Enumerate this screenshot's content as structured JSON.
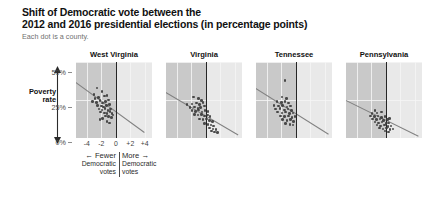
{
  "header": {
    "title_line1": "Shift of Democratic vote between the",
    "title_line2": "2012 and 2016 presidential elections (in percentage points)",
    "subtitle": "Each dot is a county."
  },
  "axes": {
    "y_label_line1": "Poverty",
    "y_label_line2": "rate",
    "y_ticks": [
      "50%",
      "25%",
      "0%"
    ],
    "x_ticks": [
      "-4",
      "-2",
      "0",
      "+2",
      "+4"
    ],
    "x_note_left_arrow": "←",
    "x_note_left_line1": "Fewer",
    "x_note_left_line2": "Democratic",
    "x_note_left_line3": "votes",
    "x_note_right_arrow": "→",
    "x_note_right_line1": "More",
    "x_note_right_line2": "Democratic",
    "x_note_right_line3": "votes"
  },
  "colors": {
    "shade_negative": "#c9c9c9",
    "shade_positive": "#e9e9e9",
    "zero_line": "#262626",
    "dot": "#3d3d3d",
    "trend_line": "#808080",
    "subtitle": "#6f6f6f"
  },
  "chart_data": {
    "type": "scatter",
    "title": "Shift of Democratic vote between the 2012 and 2016 presidential elections (in percentage points)",
    "subtitle": "Each dot is a county.",
    "xlabel": "Shift in Democratic vote (percentage points)",
    "ylabel": "Poverty rate",
    "xlim": [
      -5.5,
      5.0
    ],
    "ylim": [
      0,
      50
    ],
    "x_ticks": [
      -4,
      -2,
      0,
      2,
      4
    ],
    "y_ticks": [
      0,
      25,
      50
    ],
    "grid": true,
    "legend": "none",
    "shaded_region": "x < 0 shaded darker gray; x > 0 lighter gray; dark vertical reference line at x = 0",
    "panels": [
      {
        "name": "West Virginia",
        "trend": {
          "x0": -5.5,
          "y0": 37.0,
          "x1": 4.0,
          "y1": 4.0
        },
        "points": [
          {
            "x": -2.6,
            "y": 33.0
          },
          {
            "x": -3.0,
            "y": 28.5
          },
          {
            "x": -1.9,
            "y": 30.5
          },
          {
            "x": -2.9,
            "y": 26.0
          },
          {
            "x": -2.4,
            "y": 26.5
          },
          {
            "x": -1.6,
            "y": 27.5
          },
          {
            "x": -1.2,
            "y": 28.0
          },
          {
            "x": -3.2,
            "y": 24.0
          },
          {
            "x": -2.7,
            "y": 23.5
          },
          {
            "x": -2.2,
            "y": 24.5
          },
          {
            "x": -1.8,
            "y": 23.0
          },
          {
            "x": -1.4,
            "y": 24.0
          },
          {
            "x": -1.0,
            "y": 25.0
          },
          {
            "x": -2.5,
            "y": 21.5
          },
          {
            "x": -2.0,
            "y": 21.0
          },
          {
            "x": -1.7,
            "y": 20.5
          },
          {
            "x": -1.3,
            "y": 21.5
          },
          {
            "x": -0.9,
            "y": 22.0
          },
          {
            "x": -2.3,
            "y": 19.0
          },
          {
            "x": -1.9,
            "y": 18.5
          },
          {
            "x": -1.5,
            "y": 19.5
          },
          {
            "x": -1.1,
            "y": 18.0
          },
          {
            "x": -0.7,
            "y": 19.0
          },
          {
            "x": -2.1,
            "y": 17.0
          },
          {
            "x": -1.6,
            "y": 16.5
          },
          {
            "x": -1.2,
            "y": 16.0
          },
          {
            "x": -0.8,
            "y": 17.5
          },
          {
            "x": -0.5,
            "y": 16.0
          },
          {
            "x": -1.4,
            "y": 14.5
          },
          {
            "x": -1.0,
            "y": 14.0
          },
          {
            "x": -0.6,
            "y": 13.5
          },
          {
            "x": -1.8,
            "y": 13.0
          },
          {
            "x": -0.4,
            "y": 15.0
          },
          {
            "x": -1.2,
            "y": 11.0
          },
          {
            "x": -0.9,
            "y": 10.0
          },
          {
            "x": -2.2,
            "y": 12.0
          }
        ]
      },
      {
        "name": "Virginia",
        "trend": {
          "x0": -5.5,
          "y0": 30.0,
          "x1": 4.5,
          "y1": 2.0
        },
        "points": [
          {
            "x": -1.7,
            "y": 27.0
          },
          {
            "x": -1.0,
            "y": 26.0
          },
          {
            "x": -0.6,
            "y": 24.5
          },
          {
            "x": -2.6,
            "y": 22.0
          },
          {
            "x": -1.9,
            "y": 22.5
          },
          {
            "x": -1.3,
            "y": 23.0
          },
          {
            "x": -0.9,
            "y": 22.0
          },
          {
            "x": -0.4,
            "y": 23.5
          },
          {
            "x": -2.2,
            "y": 20.0
          },
          {
            "x": -1.6,
            "y": 20.5
          },
          {
            "x": -1.1,
            "y": 19.5
          },
          {
            "x": -0.7,
            "y": 20.0
          },
          {
            "x": -0.2,
            "y": 21.0
          },
          {
            "x": -1.9,
            "y": 18.0
          },
          {
            "x": -1.4,
            "y": 17.5
          },
          {
            "x": -1.0,
            "y": 18.5
          },
          {
            "x": -0.5,
            "y": 17.0
          },
          {
            "x": -0.1,
            "y": 18.0
          },
          {
            "x": 0.3,
            "y": 17.5
          },
          {
            "x": -1.6,
            "y": 15.5
          },
          {
            "x": -1.1,
            "y": 15.0
          },
          {
            "x": -0.6,
            "y": 15.5
          },
          {
            "x": -0.2,
            "y": 14.5
          },
          {
            "x": 0.2,
            "y": 15.0
          },
          {
            "x": 0.6,
            "y": 14.0
          },
          {
            "x": -0.9,
            "y": 12.5
          },
          {
            "x": -0.4,
            "y": 12.0
          },
          {
            "x": 0.1,
            "y": 12.5
          },
          {
            "x": 0.5,
            "y": 11.5
          },
          {
            "x": 0.9,
            "y": 11.0
          },
          {
            "x": -0.2,
            "y": 9.5
          },
          {
            "x": 0.3,
            "y": 9.0
          },
          {
            "x": 0.7,
            "y": 8.5
          },
          {
            "x": 1.1,
            "y": 8.0
          },
          {
            "x": 0.5,
            "y": 6.5
          },
          {
            "x": 1.0,
            "y": 6.0
          },
          {
            "x": 1.4,
            "y": 5.5
          },
          {
            "x": 0.8,
            "y": 4.5
          },
          {
            "x": 1.2,
            "y": 4.0
          },
          {
            "x": 1.6,
            "y": 3.5
          }
        ]
      },
      {
        "name": "Tennessee",
        "trend": {
          "x0": -5.5,
          "y0": 33.0,
          "x1": 4.5,
          "y1": 3.0
        },
        "points": [
          {
            "x": -1.5,
            "y": 38.0
          },
          {
            "x": -1.9,
            "y": 27.0
          },
          {
            "x": -1.3,
            "y": 26.0
          },
          {
            "x": -2.6,
            "y": 24.0
          },
          {
            "x": -2.0,
            "y": 23.5
          },
          {
            "x": -1.5,
            "y": 24.0
          },
          {
            "x": -1.0,
            "y": 23.0
          },
          {
            "x": -3.0,
            "y": 21.5
          },
          {
            "x": -2.4,
            "y": 21.0
          },
          {
            "x": -1.8,
            "y": 21.5
          },
          {
            "x": -1.2,
            "y": 20.5
          },
          {
            "x": -0.7,
            "y": 21.0
          },
          {
            "x": -2.8,
            "y": 19.0
          },
          {
            "x": -2.2,
            "y": 19.5
          },
          {
            "x": -1.6,
            "y": 18.5
          },
          {
            "x": -1.1,
            "y": 19.0
          },
          {
            "x": -0.6,
            "y": 18.0
          },
          {
            "x": -2.5,
            "y": 17.0
          },
          {
            "x": -1.9,
            "y": 16.5
          },
          {
            "x": -1.4,
            "y": 17.0
          },
          {
            "x": -0.9,
            "y": 16.0
          },
          {
            "x": -0.4,
            "y": 16.5
          },
          {
            "x": -2.1,
            "y": 14.5
          },
          {
            "x": -1.6,
            "y": 14.0
          },
          {
            "x": -1.0,
            "y": 14.5
          },
          {
            "x": -0.5,
            "y": 13.5
          },
          {
            "x": -0.1,
            "y": 14.0
          },
          {
            "x": -1.8,
            "y": 12.0
          },
          {
            "x": -1.2,
            "y": 11.5
          },
          {
            "x": -0.7,
            "y": 12.0
          },
          {
            "x": -0.3,
            "y": 11.0
          },
          {
            "x": -1.4,
            "y": 9.5
          },
          {
            "x": -0.8,
            "y": 9.0
          },
          {
            "x": -0.4,
            "y": 8.5
          }
        ]
      },
      {
        "name": "Pennsylvania",
        "trend": {
          "x0": -5.5,
          "y0": 25.0,
          "x1": 4.5,
          "y1": 1.5
        },
        "points": [
          {
            "x": -1.5,
            "y": 18.0
          },
          {
            "x": -1.9,
            "y": 16.0
          },
          {
            "x": -1.2,
            "y": 16.5
          },
          {
            "x": -0.6,
            "y": 17.0
          },
          {
            "x": -2.1,
            "y": 14.5
          },
          {
            "x": -1.6,
            "y": 14.0
          },
          {
            "x": -1.1,
            "y": 14.5
          },
          {
            "x": -0.6,
            "y": 13.5
          },
          {
            "x": -0.1,
            "y": 14.0
          },
          {
            "x": -1.8,
            "y": 12.5
          },
          {
            "x": -1.3,
            "y": 12.0
          },
          {
            "x": -0.8,
            "y": 12.5
          },
          {
            "x": -0.3,
            "y": 11.5
          },
          {
            "x": 0.2,
            "y": 12.0
          },
          {
            "x": -1.5,
            "y": 10.5
          },
          {
            "x": -1.0,
            "y": 10.0
          },
          {
            "x": -0.5,
            "y": 10.5
          },
          {
            "x": 0.0,
            "y": 9.5
          },
          {
            "x": 0.4,
            "y": 10.0
          },
          {
            "x": -1.2,
            "y": 8.5
          },
          {
            "x": -0.7,
            "y": 8.0
          },
          {
            "x": -0.2,
            "y": 8.5
          },
          {
            "x": 0.3,
            "y": 7.5
          },
          {
            "x": 0.7,
            "y": 8.0
          },
          {
            "x": -0.9,
            "y": 6.5
          },
          {
            "x": -0.4,
            "y": 6.0
          },
          {
            "x": 0.1,
            "y": 6.5
          },
          {
            "x": 0.6,
            "y": 5.5
          },
          {
            "x": 0.5,
            "y": 13.0
          },
          {
            "x": 1.0,
            "y": 6.0
          },
          {
            "x": -0.1,
            "y": 4.5
          },
          {
            "x": 0.4,
            "y": 4.0
          }
        ]
      }
    ]
  }
}
